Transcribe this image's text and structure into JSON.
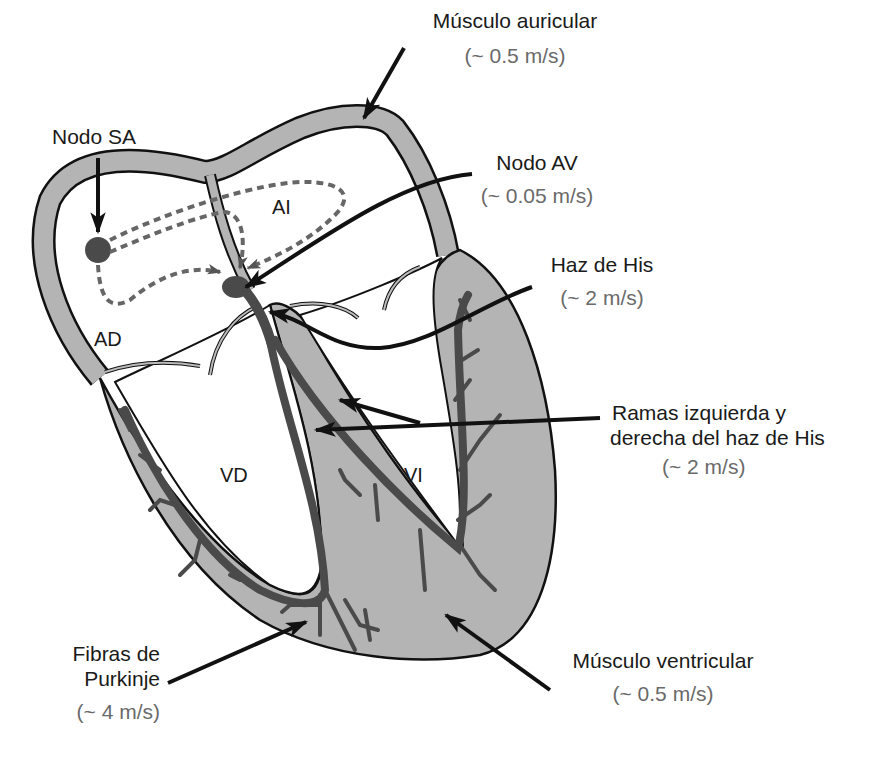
{
  "diagram": {
    "colors": {
      "wall_fill": "#b4b4b4",
      "conduction": "#4a4a4a",
      "outline": "#111111",
      "speed_text": "#6a6a6a"
    },
    "chambers": {
      "ad": "AD",
      "ai": "AI",
      "vd": "VD",
      "vi": "VI"
    },
    "labels": {
      "musculo_auricular": {
        "name": "Músculo auricular",
        "speed": "(~ 0.5 m/s)"
      },
      "nodo_sa": {
        "name": "Nodo SA"
      },
      "nodo_av": {
        "name": "Nodo AV",
        "speed": "(~ 0.05 m/s)"
      },
      "haz_his": {
        "name": "Haz de His",
        "speed": "(~ 2 m/s)"
      },
      "ramas": {
        "line1": "Ramas izquierda y",
        "line2": "derecha del haz de His",
        "speed": "(~ 2 m/s)"
      },
      "purkinje": {
        "line1": "Fibras de",
        "line2": "Purkinje",
        "speed": "(~ 4 m/s)"
      },
      "musculo_ventricular": {
        "name": "Músculo ventricular",
        "speed": "(~ 0.5 m/s)"
      }
    }
  }
}
